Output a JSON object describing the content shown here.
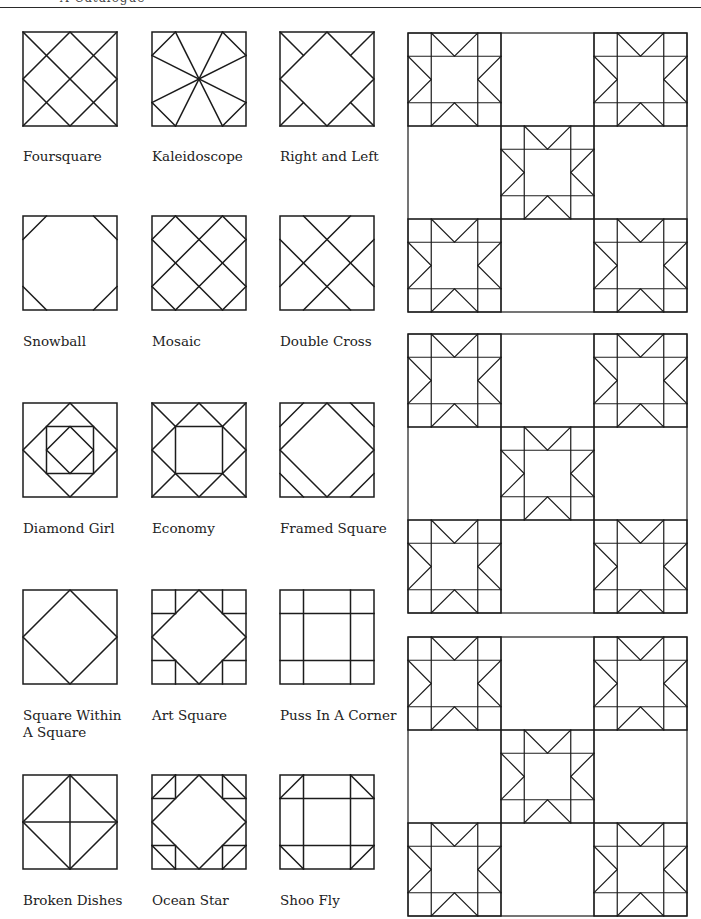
{
  "page": {
    "header_text": "A Catalogue",
    "line_color": "#1c1c1c",
    "background": "#ffffff"
  },
  "blocks": [
    {
      "name": "Foursquare",
      "row": 0,
      "col": 0
    },
    {
      "name": "Kaleidoscope",
      "row": 0,
      "col": 1
    },
    {
      "name": "Right and Left",
      "row": 0,
      "col": 2
    },
    {
      "name": "Snowball",
      "row": 1,
      "col": 0
    },
    {
      "name": "Mosaic",
      "row": 1,
      "col": 1
    },
    {
      "name": "Double Cross",
      "row": 1,
      "col": 2
    },
    {
      "name": "Diamond Girl",
      "row": 2,
      "col": 0
    },
    {
      "name": "Economy",
      "row": 2,
      "col": 1
    },
    {
      "name": "Framed Square",
      "row": 2,
      "col": 2
    },
    {
      "name": "Square Within\nA Square",
      "row": 3,
      "col": 0
    },
    {
      "name": "Art Square",
      "row": 3,
      "col": 1
    },
    {
      "name": "Puss In A Corner",
      "row": 3,
      "col": 2
    },
    {
      "name": "Broken Dishes",
      "row": 4,
      "col": 0
    },
    {
      "name": "Ocean Star",
      "row": 4,
      "col": 1
    },
    {
      "name": "Shoo Fly",
      "row": 4,
      "col": 2
    }
  ],
  "quilts": [
    {
      "pattern": "Ohio Star alternating with plain blocks",
      "grid": "3x3"
    },
    {
      "pattern": "Ohio Star alternating with plain blocks",
      "grid": "3x3"
    },
    {
      "pattern": "Ohio Star alternating with plain blocks",
      "grid": "3x3"
    }
  ]
}
